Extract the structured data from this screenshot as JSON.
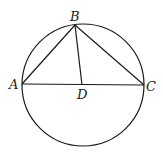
{
  "diagram": {
    "type": "geometry",
    "stroke_color": "#1a1a1a",
    "circle": {
      "cx": 83,
      "cy": 85,
      "r": 61
    },
    "points": {
      "A": {
        "label": "A",
        "x": 22,
        "y": 84
      },
      "B": {
        "label": "B",
        "x": 75,
        "y": 25
      },
      "C": {
        "label": "C",
        "x": 144,
        "y": 85
      },
      "D": {
        "label": "D",
        "x": 82,
        "y": 85
      }
    },
    "segments": [
      [
        "A",
        "B"
      ],
      [
        "B",
        "C"
      ],
      [
        "A",
        "C"
      ],
      [
        "B",
        "D"
      ]
    ],
    "labels": {
      "A": "A",
      "B": "B",
      "C": "C",
      "D": "D"
    }
  }
}
